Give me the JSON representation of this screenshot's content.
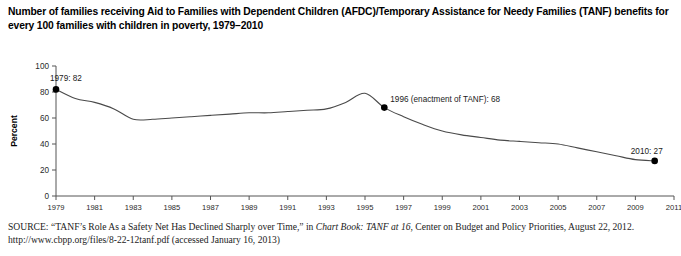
{
  "title": "Number of families receiving Aid to Families with Dependent Children (AFDC)/Temporary Assistance for Needy Families (TANF) benefits for every 100 families with children in poverty, 1979–2010",
  "source": {
    "label": "SOURCE:",
    "text_before_italic": " “TANF’s Role As a Safety Net Has Declined Sharply over Time,” in ",
    "italic_text": "Chart Book: TANF at 16",
    "text_after_italic": ", Center on Budget and Policy Priorities, August 22, 2012. http://www.cbpp.org/files/8-22-12tanf.pdf (accessed January 16, 2013)"
  },
  "chart_data": {
    "type": "line",
    "title": "",
    "xlabel": "",
    "ylabel": "Percent",
    "xlim": [
      1979,
      2011
    ],
    "ylim": [
      0,
      100
    ],
    "grid": false,
    "legend": "none",
    "line_color": "#4a4a4a",
    "marker_color": "#000000",
    "yticks": [
      0,
      20,
      40,
      60,
      80,
      100
    ],
    "ytick_labels": [
      "0",
      "20",
      "40",
      "60",
      "80",
      "100"
    ],
    "xticks": [
      1979,
      1981,
      1983,
      1985,
      1987,
      1989,
      1991,
      1993,
      1995,
      1997,
      1999,
      2001,
      2003,
      2005,
      2007,
      2009,
      2011
    ],
    "xtick_labels": [
      "1979",
      "1981",
      "1983",
      "1985",
      "1987",
      "1989",
      "1991",
      "1993",
      "1995",
      "1997",
      "1999",
      "2001",
      "2003",
      "2005",
      "2007",
      "2009",
      "2011"
    ],
    "x": [
      1979,
      1980,
      1981,
      1982,
      1983,
      1984,
      1985,
      1986,
      1987,
      1988,
      1989,
      1990,
      1991,
      1992,
      1993,
      1994,
      1995,
      1996,
      1997,
      1998,
      1999,
      2000,
      2001,
      2002,
      2003,
      2004,
      2005,
      2006,
      2007,
      2008,
      2009,
      2010
    ],
    "values": [
      82,
      75,
      72,
      67,
      59,
      59,
      60,
      61,
      62,
      63,
      64,
      64,
      65,
      66,
      67,
      72,
      79,
      68,
      61,
      55,
      50,
      47,
      45,
      43,
      42,
      41,
      40,
      37,
      34,
      31,
      28,
      27
    ],
    "annotations": [
      {
        "label": "1979: 82",
        "x": 1979,
        "y": 82,
        "marker": true
      },
      {
        "label": "1996 (enactment of TANF): 68",
        "x": 1996,
        "y": 68,
        "marker": true
      },
      {
        "label": "2010: 27",
        "x": 2010,
        "y": 27,
        "marker": true
      }
    ]
  }
}
